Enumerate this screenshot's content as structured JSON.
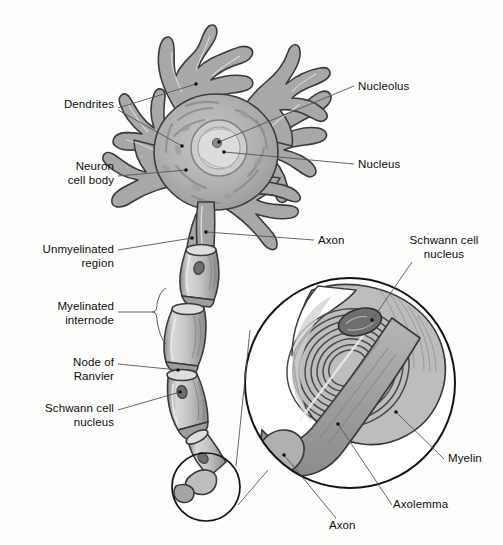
{
  "figure": {
    "background_color": "#fdfdfc",
    "ink_color": "#101010",
    "leader_color": "#555555"
  },
  "palette": {
    "cytoplasm": "#a9a9a9",
    "cytoplasm_light": "#c2c2c2",
    "nucleus_fill": "#cfcfcf",
    "nucleoplasm": "#dcdcdc",
    "nucleolus": "#8d8d8d",
    "myelin_light": "#d2d2d2",
    "myelin_mid": "#b4b4b4",
    "axon_core": "#9a9a9a",
    "outline": "#3a3a3a",
    "white": "#ffffff"
  },
  "labels": [
    {
      "id": "dendrites",
      "text": "Dendrites",
      "align": "right",
      "x": 14,
      "y": 105,
      "width": 100
    },
    {
      "id": "neuron-cell-body",
      "text": "Neuron\ncell body",
      "align": "right",
      "x": 12,
      "y": 166,
      "width": 102
    },
    {
      "id": "unmyelinated-region",
      "text": "Unmyelinated\nregion",
      "align": "right",
      "x": 8,
      "y": 243,
      "width": 106
    },
    {
      "id": "myelinated-internode",
      "text": "Myelinated\ninternode",
      "align": "right",
      "x": 12,
      "y": 300,
      "width": 102
    },
    {
      "id": "node-of-ranvier",
      "text": "Node of\nRanvier",
      "align": "right",
      "x": 18,
      "y": 356,
      "width": 96
    },
    {
      "id": "schwann-cell-nucleus-left",
      "text": "Schwann cell\nnucleus",
      "align": "right",
      "x": 6,
      "y": 402,
      "width": 108
    },
    {
      "id": "nucleolus",
      "text": "Nucleolus",
      "align": "left",
      "x": 358,
      "y": 80,
      "width": 90
    },
    {
      "id": "nucleus",
      "text": "Nucleus",
      "align": "left",
      "x": 358,
      "y": 159,
      "width": 80
    },
    {
      "id": "axon-upper",
      "text": "Axon",
      "align": "left",
      "x": 318,
      "y": 235,
      "width": 50
    },
    {
      "id": "schwann-cell-nucleus-right",
      "text": "Schwann cell\nnucleus",
      "align": "left",
      "x": 392,
      "y": 235,
      "width": 106
    },
    {
      "id": "myelin",
      "text": "Myelin",
      "align": "left",
      "x": 448,
      "y": 455,
      "width": 55
    },
    {
      "id": "axolemma",
      "text": "Axolemma",
      "align": "left",
      "x": 393,
      "y": 501,
      "width": 80
    },
    {
      "id": "axon-lower",
      "text": "Axon",
      "align": "left",
      "x": 329,
      "y": 522,
      "width": 50
    }
  ],
  "structures": {
    "soma": "cell body with radiating dendrites",
    "nucleus": "pale round nucleus inside soma",
    "nucleolus": "dark dot inside nucleus",
    "axon": "process descending from soma, unmyelinated at hillock",
    "internodes": 4,
    "nodes_of_ranvier": 3,
    "inset": "magnified circular view of Schwann cell wrapping the axon"
  }
}
